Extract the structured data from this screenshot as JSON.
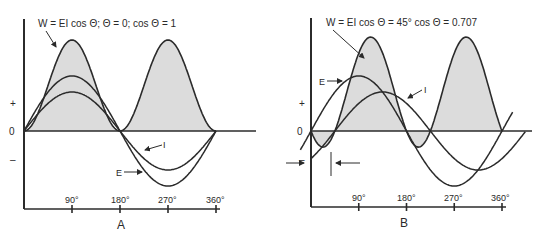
{
  "panels": [
    {
      "id": "A",
      "caption": "A",
      "title": "W = EI cos Θ; Θ = 0; cos Θ = 1",
      "axis_labels": {
        "plus": "+",
        "zero": "0",
        "minus": "–"
      },
      "ticks": [
        "90°",
        "180°",
        "270°",
        "360°"
      ],
      "curve_labels": {
        "E": "E",
        "I": "I"
      }
    },
    {
      "id": "B",
      "caption": "B",
      "title": "W = EI cos Θ = 45° cos Θ = 0.707",
      "axis_labels": {
        "plus": "+",
        "zero": "0",
        "minus": "–"
      },
      "ticks": [
        "90°",
        "180°",
        "270°",
        "360°"
      ],
      "curve_labels": {
        "E": "E",
        "I": "I"
      }
    }
  ],
  "chart_data": [
    {
      "type": "line",
      "title": "W = EI cos Θ; Θ = 0; cos Θ = 1",
      "caption": "A",
      "x_ticks": [
        "90°",
        "180°",
        "270°",
        "360°"
      ],
      "series": [
        {
          "name": "W (power)",
          "shape": "sin^2, always positive, shaded",
          "peak_relative": 1.0
        },
        {
          "name": "E",
          "shape": "sine, in phase",
          "peak_relative": 0.6
        },
        {
          "name": "I",
          "shape": "sine, in phase",
          "peak_relative": 0.42
        }
      ],
      "phase_angle_deg": 0
    },
    {
      "type": "line",
      "title": "W = EI cos Θ = 45° cos Θ = 0.707",
      "caption": "B",
      "x_ticks": [
        "90°",
        "180°",
        "270°",
        "360°"
      ],
      "series": [
        {
          "name": "W (power)",
          "shape": "shaded, with small negative lobes",
          "peak_relative": 1.0
        },
        {
          "name": "E",
          "shape": "sine leading",
          "peak_relative": 0.6
        },
        {
          "name": "I",
          "shape": "sine lagging 45°",
          "peak_relative": 0.42
        }
      ],
      "phase_angle_deg": 45
    }
  ]
}
